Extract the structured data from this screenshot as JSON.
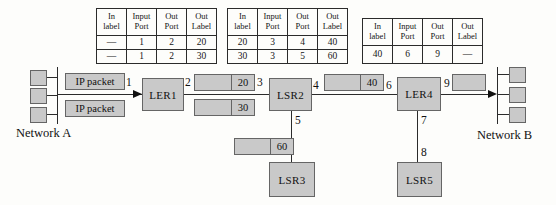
{
  "colors": {
    "background": "#fdfdfb",
    "box_fill": "#c9c9c9",
    "box_border": "#656565",
    "line": "#2b2b2b",
    "text": "#111111"
  },
  "table_headers": [
    {
      "l1": "In",
      "l2": "label"
    },
    {
      "l1": "Input",
      "l2": "Port"
    },
    {
      "l1": "Out",
      "l2": "Port"
    },
    {
      "l1": "Out",
      "l2": "Label"
    }
  ],
  "tables": [
    {
      "name": "LER1 forwarding table",
      "rows": [
        [
          "—",
          "1",
          "2",
          "20"
        ],
        [
          "—",
          "1",
          "2",
          "30"
        ]
      ]
    },
    {
      "name": "LSR2 forwarding table",
      "rows": [
        [
          "20",
          "3",
          "4",
          "40"
        ],
        [
          "30",
          "3",
          "5",
          "60"
        ]
      ]
    },
    {
      "name": "LER4 forwarding table",
      "rows": [
        [
          "40",
          "6",
          "9",
          "—"
        ]
      ]
    }
  ],
  "nodes": {
    "ler1": "LER1",
    "lsr2": "LSR2",
    "lsr3": "LSR3",
    "ler4": "LER4",
    "lsr5": "LSR5"
  },
  "packets": {
    "ip_packet_top": "IP packet",
    "ip_packet_bottom": "IP packet",
    "label_20": "20",
    "label_30": "30",
    "label_40": "40",
    "label_60": "60"
  },
  "ports": {
    "p1": "1",
    "p2": "2",
    "p3": "3",
    "p4": "4",
    "p5": "5",
    "p6": "6",
    "p7": "7",
    "p8": "8",
    "p9": "9"
  },
  "networks": {
    "a": "Network A",
    "b": "Network B"
  }
}
